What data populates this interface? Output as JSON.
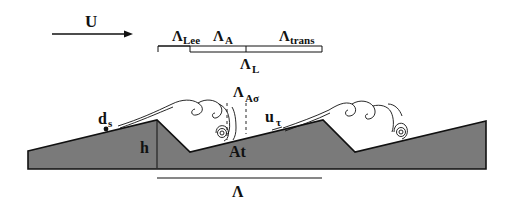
{
  "diagram": {
    "flow_label": "U",
    "scales": {
      "lee": {
        "symbol": "Λ",
        "sub": "Lee"
      },
      "a": {
        "symbol": "Λ",
        "sub": "A"
      },
      "trans": {
        "symbol": "Λ",
        "sub": "trans"
      },
      "l": {
        "symbol": "Λ",
        "sub": "L"
      },
      "a_sigma": {
        "symbol": "Λ",
        "sub": "Aσ"
      }
    },
    "labels": {
      "ds": "d",
      "ds_sub": "s",
      "h": "h",
      "at": "At",
      "utau": "u",
      "utau_sub": "τ",
      "wavelength": "Λ"
    },
    "colors": {
      "bed_fill": "#7a7a7a",
      "line": "#111111",
      "background": "#ffffff"
    }
  }
}
